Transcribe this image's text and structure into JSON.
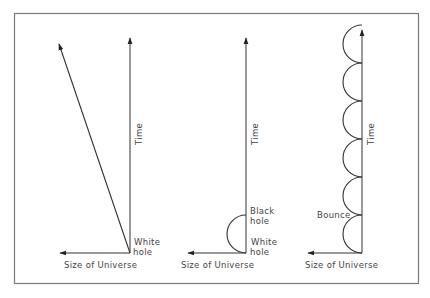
{
  "diagram": {
    "frame_color": "#777777",
    "line_color": "#333333",
    "panels": [
      {
        "id": "white-hole",
        "time_label": "Time",
        "x_label": "Size of Universe",
        "origin_label": "White\nhole",
        "origin_label_line1": "White",
        "origin_label_line2": "hole"
      },
      {
        "id": "black-white-hole",
        "time_label": "Time",
        "x_label": "Size of Universe",
        "upper_label_line1": "Black",
        "upper_label_line2": "hole",
        "origin_label_line1": "White",
        "origin_label_line2": "hole"
      },
      {
        "id": "bounce",
        "time_label": "Time",
        "x_label": "Size of Universe",
        "bounce_label": "Bounce",
        "bounce_count": 6
      }
    ]
  }
}
